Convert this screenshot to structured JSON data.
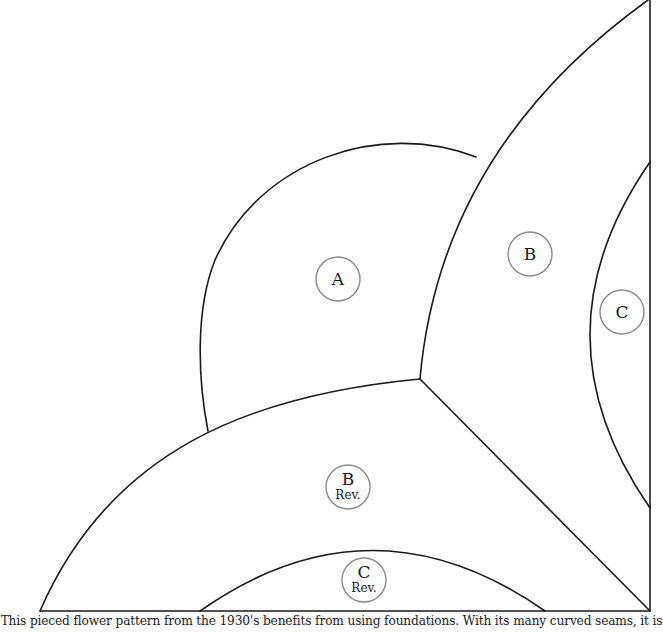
{
  "diagram": {
    "pieces": [
      {
        "id": "A",
        "label": "A",
        "sub": ""
      },
      {
        "id": "B",
        "label": "B",
        "sub": ""
      },
      {
        "id": "C",
        "label": "C",
        "sub": ""
      },
      {
        "id": "B-rev",
        "label": "B",
        "sub": "Rev."
      },
      {
        "id": "C-rev",
        "label": "C",
        "sub": "Rev."
      }
    ],
    "colors": {
      "line": "#1a1a1a",
      "label_circle": "#8a8a8a",
      "background": "#ffffff"
    }
  },
  "caption": {
    "text": "This pieced flower pattern from the 1930's benefits from using foundations. With its many curved seams, it is"
  }
}
